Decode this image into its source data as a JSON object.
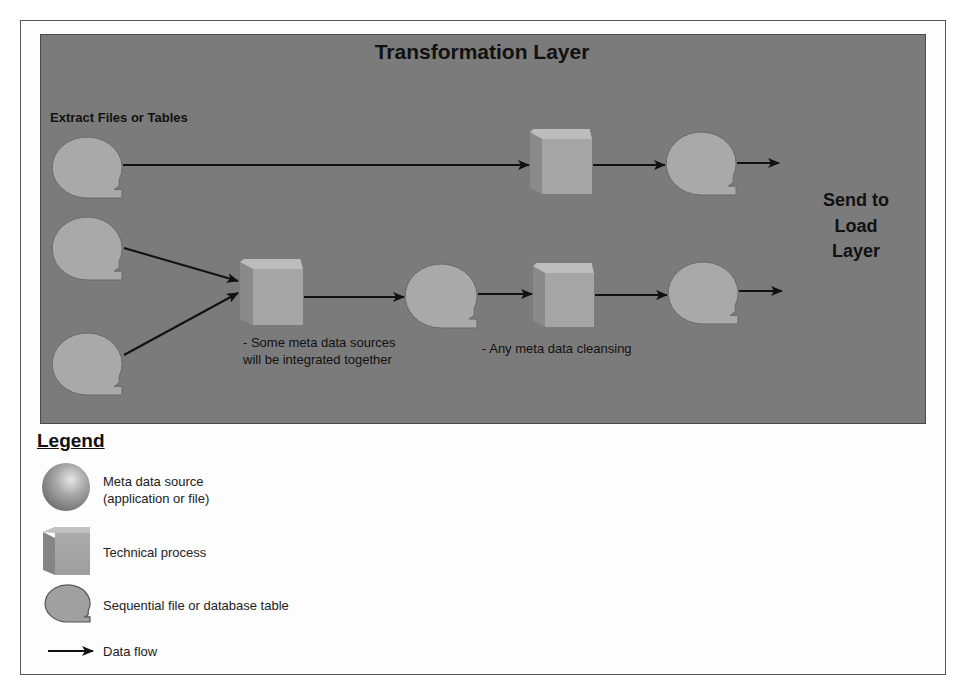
{
  "diagram": {
    "title": "Transformation Layer",
    "extract_label": "Extract Files or Tables",
    "send_label": [
      "Send to",
      "Load",
      "Layer"
    ],
    "notes": {
      "integrate": [
        "- Some meta data sources",
        "will be integrated together"
      ],
      "cleanse": "- Any meta data cleansing"
    },
    "colors": {
      "panel_bg": "#7b7b7b",
      "shape_fill": "#a9a9a9",
      "cube_top": "#bdbdbd",
      "cube_front": "#a5a5a5",
      "cube_side": "#8a8a8a",
      "arrow": "#111111"
    },
    "nodes": [
      {
        "id": "src1",
        "type": "sequential-file",
        "x": 52,
        "y": 137,
        "w": 70,
        "h": 61
      },
      {
        "id": "src2",
        "type": "sequential-file",
        "x": 52,
        "y": 217,
        "w": 70,
        "h": 63
      },
      {
        "id": "src3",
        "type": "sequential-file",
        "x": 52,
        "y": 333,
        "w": 70,
        "h": 62
      },
      {
        "id": "proc-top",
        "type": "technical-process",
        "x": 530,
        "y": 129,
        "w": 62,
        "h": 65
      },
      {
        "id": "out-top",
        "type": "sequential-file",
        "x": 666,
        "y": 132,
        "w": 70,
        "h": 63
      },
      {
        "id": "proc-integrate",
        "type": "technical-process",
        "x": 240,
        "y": 259,
        "w": 63,
        "h": 66
      },
      {
        "id": "mid-table",
        "type": "sequential-file",
        "x": 405,
        "y": 264,
        "w": 72,
        "h": 64
      },
      {
        "id": "proc-cleanse",
        "type": "technical-process",
        "x": 533,
        "y": 263,
        "w": 61,
        "h": 64
      },
      {
        "id": "out-bottom",
        "type": "sequential-file",
        "x": 668,
        "y": 262,
        "w": 70,
        "h": 62
      }
    ],
    "flows": [
      {
        "from": "src1",
        "to": "proc-top",
        "x1": 123,
        "y1": 165,
        "x2": 529,
        "y2": 165
      },
      {
        "from": "proc-top",
        "to": "out-top",
        "x1": 593,
        "y1": 165,
        "x2": 665,
        "y2": 165
      },
      {
        "from": "out-top",
        "to": "send",
        "x1": 737,
        "y1": 163,
        "x2": 779,
        "y2": 163
      },
      {
        "from": "src2",
        "to": "proc-integrate",
        "x1": 124,
        "y1": 248,
        "x2": 238,
        "y2": 281
      },
      {
        "from": "src3",
        "to": "proc-integrate",
        "x1": 124,
        "y1": 355,
        "x2": 238,
        "y2": 293
      },
      {
        "from": "proc-integrate",
        "to": "mid-table",
        "x1": 304,
        "y1": 297,
        "x2": 404,
        "y2": 297
      },
      {
        "from": "mid-table",
        "to": "proc-cleanse",
        "x1": 478,
        "y1": 294,
        "x2": 532,
        "y2": 294
      },
      {
        "from": "proc-cleanse",
        "to": "out-bottom",
        "x1": 595,
        "y1": 295,
        "x2": 667,
        "y2": 295
      },
      {
        "from": "out-bottom",
        "to": "send",
        "x1": 739,
        "y1": 291,
        "x2": 782,
        "y2": 291
      }
    ]
  },
  "legend": {
    "title": "Legend",
    "items": [
      {
        "icon": "meta-data-source-sphere",
        "label": [
          "Meta data source",
          "(application or file)"
        ]
      },
      {
        "icon": "technical-process-cube",
        "label": [
          "Technical process"
        ]
      },
      {
        "icon": "sequential-file-shape",
        "label": [
          "Sequential file or database table"
        ]
      },
      {
        "icon": "data-flow-arrow",
        "label": [
          "Data flow"
        ]
      }
    ]
  }
}
